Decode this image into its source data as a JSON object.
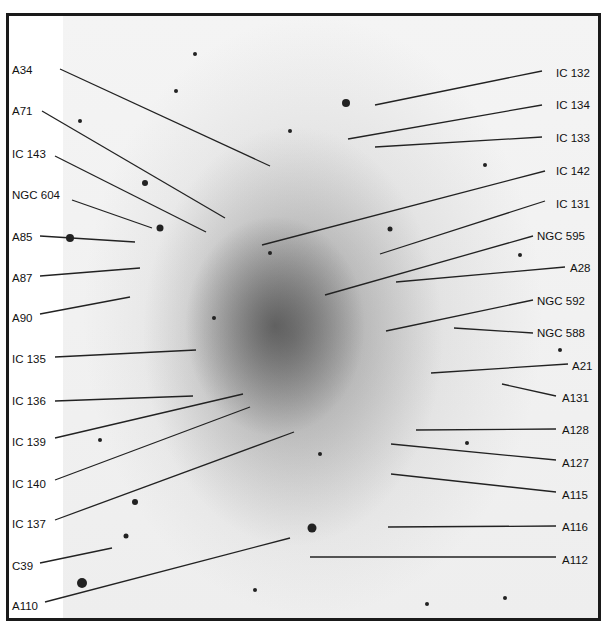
{
  "figure": {
    "frame_color": "#1a1a1a",
    "label_color": "#111111"
  },
  "labels_left": [
    {
      "text": "A34",
      "x": 12,
      "y": 74,
      "line": [
        60,
        69,
        270,
        166
      ]
    },
    {
      "text": "A71",
      "x": 12,
      "y": 115,
      "line": [
        42,
        111,
        225,
        218
      ]
    },
    {
      "text": "IC 143",
      "x": 12,
      "y": 158,
      "line": [
        55,
        156,
        206,
        232
      ]
    },
    {
      "text": "NGC 604",
      "x": 12,
      "y": 199,
      "line": [
        72,
        200,
        152,
        228
      ]
    },
    {
      "text": "A85",
      "x": 12,
      "y": 241,
      "line": [
        40,
        236,
        135,
        242
      ]
    },
    {
      "text": "A87",
      "x": 12,
      "y": 282,
      "line": [
        40,
        276,
        140,
        268
      ]
    },
    {
      "text": "A90",
      "x": 12,
      "y": 322,
      "line": [
        40,
        314,
        130,
        297
      ]
    },
    {
      "text": "IC 135",
      "x": 12,
      "y": 363,
      "line": [
        55,
        357,
        196,
        350
      ]
    },
    {
      "text": "IC 136",
      "x": 12,
      "y": 405,
      "line": [
        55,
        401,
        193,
        396
      ]
    },
    {
      "text": "IC 139",
      "x": 12,
      "y": 446,
      "line": [
        55,
        438,
        243,
        394
      ]
    },
    {
      "text": "IC 140",
      "x": 12,
      "y": 488,
      "line": [
        55,
        480,
        250,
        407
      ]
    },
    {
      "text": "IC 137",
      "x": 12,
      "y": 528,
      "line": [
        55,
        520,
        294,
        432
      ]
    },
    {
      "text": "C39",
      "x": 12,
      "y": 570,
      "line": [
        40,
        563,
        112,
        548
      ]
    },
    {
      "text": "A110",
      "x": 12,
      "y": 610,
      "line": [
        45,
        602,
        290,
        538
      ]
    }
  ],
  "labels_right": [
    {
      "text": "IC 132",
      "x": 556,
      "y": 77,
      "line": [
        542,
        71,
        375,
        105
      ]
    },
    {
      "text": "IC 134",
      "x": 556,
      "y": 109,
      "line": [
        542,
        105,
        348,
        139
      ]
    },
    {
      "text": "IC 133",
      "x": 556,
      "y": 142,
      "line": [
        542,
        137,
        375,
        147
      ]
    },
    {
      "text": "IC 142",
      "x": 556,
      "y": 175,
      "line": [
        545,
        171,
        262,
        245
      ]
    },
    {
      "text": "IC 131",
      "x": 556,
      "y": 208,
      "line": [
        545,
        201,
        380,
        254
      ]
    },
    {
      "text": "NGC 595",
      "x": 537,
      "y": 240,
      "line": [
        533,
        236,
        325,
        295
      ]
    },
    {
      "text": "A28",
      "x": 570,
      "y": 272,
      "line": [
        565,
        267,
        396,
        282
      ]
    },
    {
      "text": "NGC 592",
      "x": 537,
      "y": 305,
      "line": [
        533,
        300,
        386,
        331
      ]
    },
    {
      "text": "NGC 588",
      "x": 537,
      "y": 337,
      "line": [
        533,
        333,
        454,
        328
      ]
    },
    {
      "text": "A21",
      "x": 572,
      "y": 370,
      "line": [
        568,
        364,
        431,
        373
      ]
    },
    {
      "text": "A131",
      "x": 562,
      "y": 402,
      "line": [
        556,
        396,
        502,
        384
      ]
    },
    {
      "text": "A128",
      "x": 562,
      "y": 434,
      "line": [
        556,
        429,
        416,
        430
      ]
    },
    {
      "text": "A127",
      "x": 562,
      "y": 467,
      "line": [
        556,
        460,
        391,
        444
      ]
    },
    {
      "text": "A115",
      "x": 562,
      "y": 499,
      "line": [
        556,
        492,
        391,
        474
      ]
    },
    {
      "text": "A116",
      "x": 562,
      "y": 531,
      "line": [
        556,
        526,
        388,
        527
      ]
    },
    {
      "text": "A112",
      "x": 562,
      "y": 564,
      "line": [
        556,
        557,
        310,
        557
      ]
    }
  ]
}
